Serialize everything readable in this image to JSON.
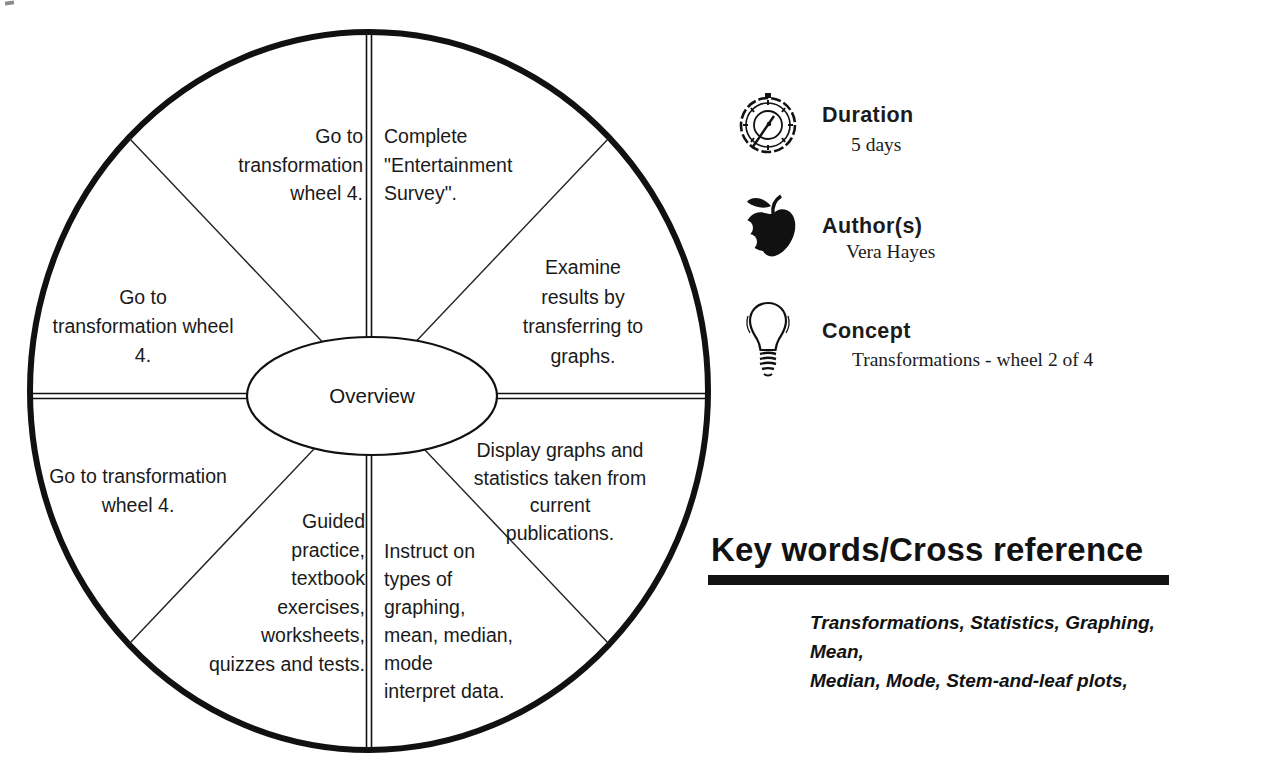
{
  "wheel": {
    "center_label": "Overview",
    "sectors": {
      "top_left": "Go to\ntransformation\nwheel 4.",
      "top_right": "Complete\n\"Entertainment\nSurvey\".",
      "right_upper": "Examine\nresults by\ntransferring to\ngraphs.",
      "right_lower": "Display graphs and\nstatistics taken from\ncurrent\npublications.",
      "bottom_right": "Instruct on\ntypes of\ngraphing,\nmean, median,\nmode\ninterpret data.",
      "bottom_left": "Guided\npractice,\ntextbook\nexercises,\nworksheets,\nquizzes and tests.",
      "left_lower": "Go to transformation\nwheel 4.",
      "left_upper": "Go to\ntransformation wheel\n4."
    }
  },
  "info_panel": {
    "items": [
      {
        "icon": "stopwatch-icon",
        "label": "Duration",
        "value": "5 days"
      },
      {
        "icon": "apple-icon",
        "label": "Author(s)",
        "value": "Vera Hayes"
      },
      {
        "icon": "lightbulb-icon",
        "label": "Concept",
        "value": "Transformations - wheel 2 of 4"
      }
    ]
  },
  "keywords_section": {
    "heading": "Key words/Cross reference",
    "keywords": "Transformations, Statistics, Graphing, Mean,\nMedian, Mode, Stem-and-leaf plots,"
  },
  "colors": {
    "ink": "#111111",
    "background": "#ffffff"
  }
}
